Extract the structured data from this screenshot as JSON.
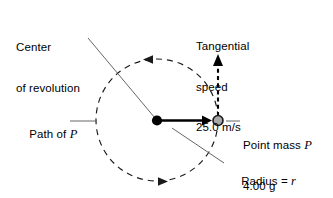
{
  "figure": {
    "type": "physics-diagram",
    "background_color": "#ffffff",
    "ink_color": "#000000",
    "leader_line_color": "#555555",
    "mass_fill_color": "#a8a8a8"
  },
  "labels": {
    "center": {
      "line1": "Center",
      "line2": "of revolution"
    },
    "tangential": {
      "line1": "Tangential",
      "line2": "speed",
      "line3": "25.0 m/s",
      "value": "25.0",
      "units": "m/s"
    },
    "path": {
      "prefix": "Path of ",
      "symbol": "P"
    },
    "point_mass": {
      "line1_prefix": "Point mass ",
      "line1_symbol": "P",
      "line2": "4.00 g",
      "mass_value": "4.00",
      "mass_units": "g"
    },
    "radius": {
      "prefix": "Radius = ",
      "symbol": "r"
    }
  },
  "geometry": {
    "center_point": {
      "x": 157,
      "y": 120
    },
    "point_mass": {
      "x": 218,
      "y": 121
    },
    "orbit_radius": 61,
    "rotation_direction": "counterclockwise",
    "velocity_arrow": {
      "from_y": 116,
      "to_y": 56,
      "direction": "up",
      "tangent": true
    }
  }
}
